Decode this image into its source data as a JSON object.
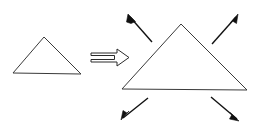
{
  "figure": {
    "background_color": "#ffffff",
    "stroke_color": "#3a3a3a",
    "arrow_color": "#111111",
    "width": 255,
    "height": 129,
    "shapes": {
      "small_triangle": {
        "label": "small-triangle",
        "points": "44,37 81,74 13,73",
        "apex": [
          44,
          37
        ],
        "base_left": [
          13,
          73
        ],
        "base_right": [
          81,
          74
        ]
      },
      "large_triangle": {
        "label": "large-triangle",
        "points": "181,24 247,90 122,89",
        "apex": [
          181,
          24
        ],
        "base_left": [
          122,
          89
        ],
        "base_right": [
          247,
          90
        ]
      }
    },
    "transform_arrow": {
      "label": "transformation-arrow",
      "direction": "right",
      "style": "outline-double-line",
      "outline_points": "91,53 117,53 117,49 129,57.5 117,66 117,62 91,62 91,59.5 114.5,59.5 114.5,55.5 91,55.5"
    },
    "expansion_arrows": [
      {
        "label": "arrow-up-left",
        "direction": "up-left",
        "tail": [
          152,
          42
        ],
        "tip": [
          128,
          14
        ],
        "head_points": "128,14 135.5,21.5 131,23.5 126.5,22"
      },
      {
        "label": "arrow-up-right",
        "direction": "up-right",
        "tail": [
          212,
          44
        ],
        "tip": [
          238,
          14
        ],
        "head_points": "238,14 236.5,23.5 232.5,21 230.5,22.5"
      },
      {
        "label": "arrow-down-left",
        "direction": "down-left",
        "tail": [
          148,
          98
        ],
        "tip": [
          121,
          120
        ],
        "head_points": "121,120 123,110.5 127,113 129,111"
      },
      {
        "label": "arrow-down-right",
        "direction": "down-right",
        "tail": [
          211,
          97
        ],
        "tip": [
          239,
          121
        ],
        "head_points": "239,121 229.5,119 232,114.5 230,112.5"
      }
    ]
  }
}
